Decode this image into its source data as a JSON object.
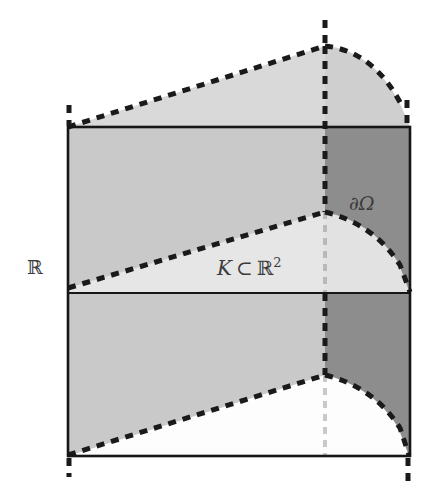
{
  "figure": {
    "background_color": "#ffffff",
    "width": 425,
    "height": 499
  },
  "labels": {
    "vertical_axis": {
      "text": "ℝ",
      "name": "real-line-label",
      "x": 27,
      "y": 256
    },
    "base_set": {
      "prefix": "K",
      "relation": "⊂",
      "space": "ℝ",
      "exponent": "2",
      "text": "K ⊂ ℝ²",
      "name": "compact-set-label",
      "x": 217,
      "y": 256
    },
    "boundary": {
      "text": "∂Ω",
      "name": "boundary-label",
      "x": 349,
      "y": 192
    }
  },
  "colors": {
    "stroke": "#1a1a1a",
    "dash": "#1a1a1a",
    "fill_front_slab": "#c9c9c9",
    "fill_mid_band_light": "#e6e6e6",
    "fill_right_dark": "#8d8d8d",
    "fill_top_dome": "#d7d7d7",
    "fill_white": "#ffffff",
    "label_text": "#3c3c3c",
    "faint_dash": "#b8b8b8"
  },
  "geometry": {
    "rect_left": 68,
    "rect_right": 410,
    "rect_top": 127,
    "rect_bottom": 456,
    "mid_line_y": 293,
    "center_x": 325,
    "upper_node_y": 212,
    "lower_node_y": 375,
    "dome_apex_y": 46,
    "dome_right_end_x": 408,
    "dome_right_end_y": 105,
    "stroke_width": 2.4,
    "dash_width": 5,
    "dash_pattern": "7 6"
  },
  "elements": {
    "solid_rectangle": "outer-rectangle",
    "mid_horizontal_line": "mid-horizontal-line",
    "vertical_center_dashed": "center-vertical-dashed",
    "upper_ruling_dashed": "upper-ruling-dashed",
    "lower_ruling_dashed": "lower-ruling-dashed",
    "top_dome_dashed": "top-dome-dashed",
    "mid_arc_dashed": "mid-arc-dashed",
    "bottom_arc_dashed": "bottom-arc-dashed"
  }
}
